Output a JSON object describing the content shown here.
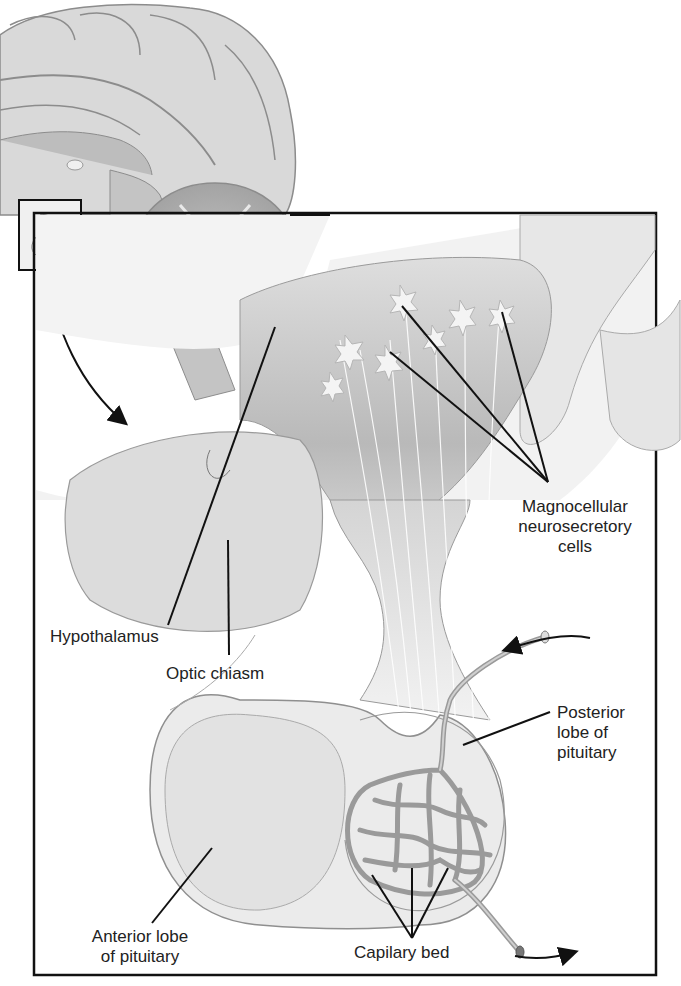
{
  "figure": {
    "inset_box": "brain midsagittal view with pituitary region highlighted",
    "colors": {
      "frame": "#111111",
      "tissue_light": "#e6e6e6",
      "tissue_mid": "#c9c9c9",
      "tissue_dark": "#a8a8a8",
      "vessel": "#9a9a9a",
      "leader_line": "#111111",
      "text": "#222222"
    }
  },
  "labels": {
    "magnocellular": "Magnocellular\nneurosecretory\ncells",
    "hypothalamus": "Hypothalamus",
    "optic_chiasm": "Optic chiasm",
    "posterior_lobe": "Posterior\nlobe of\npituitary",
    "anterior_lobe": "Anterior lobe\nof pituitary",
    "capillary_bed": "Capilary bed"
  }
}
